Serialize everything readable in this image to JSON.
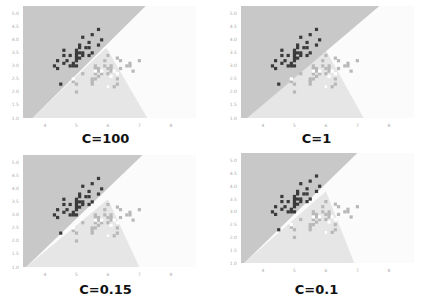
{
  "chart_data": [
    {
      "type": "scatter",
      "title": "C=100",
      "xlabel": "",
      "ylabel": "",
      "xlim": [
        3.3,
        8.8
      ],
      "ylim": [
        1.0,
        5.3
      ],
      "xticks": [
        "4",
        "5",
        "6",
        "7",
        "8"
      ],
      "yticks": [
        "1.0",
        "1.5",
        "2.0",
        "2.5",
        "3.0",
        "3.5",
        "4.0",
        "4.5",
        "5.0"
      ],
      "grid": false,
      "regions": {
        "dark_boundary": [
          [
            3.6,
            1.0
          ],
          [
            7.2,
            5.3
          ]
        ],
        "split_point": [
          5.95,
          3.7
        ],
        "light_boundary_end": [
          7.25,
          1.0
        ]
      }
    },
    {
      "type": "scatter",
      "title": "C=1",
      "xlabel": "",
      "ylabel": "",
      "xlim": [
        3.3,
        8.8
      ],
      "ylim": [
        1.0,
        5.3
      ],
      "xticks": [
        "4",
        "5",
        "6",
        "7",
        "8"
      ],
      "yticks": [
        "1.0",
        "1.5",
        "2.0",
        "2.5",
        "3.0",
        "3.5",
        "4.0",
        "4.5",
        "5.0"
      ],
      "grid": false,
      "regions": {
        "dark_boundary": [
          [
            3.5,
            1.0
          ],
          [
            7.7,
            5.3
          ]
        ],
        "split_point": [
          6.0,
          3.6
        ],
        "light_boundary_end": [
          7.2,
          1.0
        ]
      }
    },
    {
      "type": "scatter",
      "title": "C=0.15",
      "xlabel": "",
      "ylabel": "",
      "xlim": [
        3.3,
        8.8
      ],
      "ylim": [
        1.0,
        5.3
      ],
      "xticks": [
        "4",
        "5",
        "6",
        "7",
        "8"
      ],
      "yticks": [
        "1.0",
        "1.5",
        "2.0",
        "2.5",
        "3.0",
        "3.5",
        "4.0",
        "4.5",
        "5.0"
      ],
      "grid": false,
      "regions": {
        "dark_boundary": [
          [
            3.4,
            1.0
          ],
          [
            7.1,
            5.3
          ]
        ],
        "split_point": [
          6.0,
          3.6
        ],
        "light_boundary_end": [
          7.0,
          1.0
        ]
      }
    },
    {
      "type": "scatter",
      "title": "C=0.1",
      "xlabel": "",
      "ylabel": "",
      "xlim": [
        3.3,
        8.8
      ],
      "ylim": [
        1.0,
        5.3
      ],
      "xticks": [
        "4",
        "5",
        "6",
        "7",
        "8"
      ],
      "yticks": [
        "1.0",
        "1.5",
        "2.0",
        "2.5",
        "3.0",
        "3.5",
        "4.0",
        "4.5",
        "5.0"
      ],
      "grid": false,
      "regions": {
        "dark_boundary": [
          [
            3.4,
            1.0
          ],
          [
            7.0,
            5.3
          ]
        ],
        "split_point": [
          6.0,
          3.8
        ],
        "light_boundary_end": [
          6.9,
          1.0
        ]
      }
    }
  ],
  "series": {
    "class0": {
      "color": "#3a3a3a",
      "points": [
        [
          4.3,
          3.0
        ],
        [
          4.4,
          2.9
        ],
        [
          4.4,
          3.2
        ],
        [
          4.5,
          2.3
        ],
        [
          4.6,
          3.1
        ],
        [
          4.6,
          3.4
        ],
        [
          4.6,
          3.6
        ],
        [
          4.7,
          3.2
        ],
        [
          4.8,
          3.0
        ],
        [
          4.8,
          3.4
        ],
        [
          4.9,
          3.0
        ],
        [
          4.9,
          3.1
        ],
        [
          5.0,
          3.0
        ],
        [
          5.0,
          3.2
        ],
        [
          5.0,
          3.3
        ],
        [
          5.0,
          3.4
        ],
        [
          5.0,
          3.5
        ],
        [
          5.0,
          3.6
        ],
        [
          5.1,
          3.3
        ],
        [
          5.1,
          3.5
        ],
        [
          5.1,
          3.7
        ],
        [
          5.1,
          3.8
        ],
        [
          5.2,
          3.4
        ],
        [
          5.2,
          3.5
        ],
        [
          5.2,
          4.1
        ],
        [
          5.3,
          3.7
        ],
        [
          5.4,
          3.4
        ],
        [
          5.4,
          3.7
        ],
        [
          5.4,
          3.9
        ],
        [
          5.5,
          3.5
        ],
        [
          5.5,
          4.2
        ],
        [
          5.7,
          3.8
        ],
        [
          5.7,
          4.4
        ],
        [
          5.8,
          4.0
        ]
      ]
    },
    "class1": {
      "color": "#b8b8b8",
      "points": [
        [
          4.9,
          2.4
        ],
        [
          5.0,
          2.0
        ],
        [
          5.0,
          2.3
        ],
        [
          5.2,
          2.7
        ],
        [
          5.5,
          2.3
        ],
        [
          5.5,
          2.4
        ],
        [
          5.5,
          2.5
        ],
        [
          5.6,
          2.5
        ],
        [
          5.6,
          2.7
        ],
        [
          5.6,
          2.9
        ],
        [
          5.6,
          3.0
        ],
        [
          5.7,
          2.6
        ],
        [
          5.7,
          2.8
        ],
        [
          5.7,
          2.9
        ],
        [
          5.8,
          2.7
        ],
        [
          5.9,
          3.0
        ],
        [
          5.9,
          3.2
        ],
        [
          6.0,
          2.2
        ],
        [
          6.0,
          2.7
        ],
        [
          6.0,
          2.9
        ],
        [
          6.0,
          3.4
        ],
        [
          6.1,
          2.8
        ],
        [
          6.1,
          2.9
        ],
        [
          6.1,
          3.0
        ],
        [
          6.2,
          2.2
        ],
        [
          6.3,
          2.3
        ],
        [
          6.3,
          2.5
        ],
        [
          6.3,
          3.3
        ],
        [
          6.4,
          2.9
        ],
        [
          6.4,
          3.2
        ],
        [
          6.6,
          3.0
        ],
        [
          6.7,
          3.0
        ],
        [
          6.7,
          3.1
        ],
        [
          6.8,
          2.8
        ],
        [
          7.0,
          3.2
        ]
      ]
    },
    "class2_white": {
      "color": "#ffffff",
      "points": [
        [
          4.9,
          2.5
        ],
        [
          5.6,
          2.8
        ],
        [
          5.8,
          2.8
        ],
        [
          6.0,
          2.2
        ],
        [
          6.1,
          2.6
        ],
        [
          6.2,
          2.8
        ],
        [
          6.3,
          2.7
        ]
      ]
    }
  },
  "colors": {
    "dark_region": "#c8c8c8",
    "light_region": "#e6e6e6",
    "white_region": "#fbfbfb"
  },
  "captions": [
    "C=100",
    "C=1",
    "C=0.15",
    "C=0.1"
  ]
}
